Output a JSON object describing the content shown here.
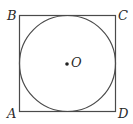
{
  "figure": {
    "type": "geometry",
    "square": {
      "vertices": {
        "A": "A",
        "B": "B",
        "C": "C",
        "D": "D"
      }
    },
    "circle": {
      "center_label": "O"
    },
    "colors": {
      "stroke": "#4a4a4a",
      "text": "#2a2a2a",
      "background": "#ffffff"
    }
  }
}
